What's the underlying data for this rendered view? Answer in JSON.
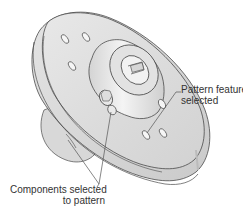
{
  "figure": {
    "callouts": [
      {
        "id": "pattern-feature",
        "lines": [
          "Pattern feature",
          "selected"
        ]
      },
      {
        "id": "components",
        "lines": [
          "Components selected",
          "to pattern"
        ]
      }
    ]
  },
  "colors": {
    "background": "#ffffff",
    "part_fill": "#dedede",
    "part_fill_light": "#ececec",
    "part_fill_dark": "#c8c8c8",
    "outline": "#4a4a4a",
    "leader": "#555555",
    "text": "#333333"
  }
}
